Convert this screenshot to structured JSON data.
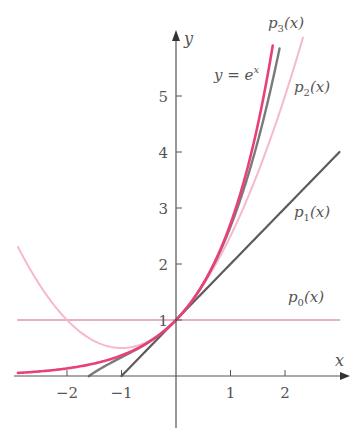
{
  "chart_data": {
    "type": "line",
    "title": "",
    "xlabel": "x",
    "ylabel": "y",
    "xlim": [
      -2.9,
      3.0
    ],
    "ylim": [
      0,
      6
    ],
    "grid": false,
    "legend": "inline labels",
    "x_ticks": [
      -2,
      -1,
      1,
      2
    ],
    "x_tick_labels": [
      "−2",
      "−1",
      "1",
      "2"
    ],
    "y_ticks": [
      1,
      2,
      3,
      4,
      5
    ],
    "y_tick_labels": [
      "1",
      "2",
      "3",
      "4",
      "5"
    ],
    "series": [
      {
        "name": "y = e^x",
        "label": "y = e",
        "label_sup": "x",
        "formula": "exp",
        "color": "#e8417a",
        "width": 2.6,
        "x_range": [
          -2.9,
          1.775
        ]
      },
      {
        "name": "p3(x)",
        "label": "p",
        "label_sub": "3",
        "label_tail": "(x)",
        "formula": "p3",
        "color": "#7a7a7a",
        "width": 2.4,
        "x_range": [
          -1.6,
          1.9
        ]
      },
      {
        "name": "p2(x)",
        "label": "p",
        "label_sub": "2",
        "label_tail": "(x)",
        "formula": "p2",
        "color": "#f5b8cf",
        "width": 2.0,
        "x_range": [
          -2.9,
          2.33
        ]
      },
      {
        "name": "p1(x)",
        "label": "p",
        "label_sub": "1",
        "label_tail": "(x)",
        "formula": "p1",
        "color": "#5f5a5c",
        "width": 2.2,
        "x_range": [
          -1.0,
          3.0
        ]
      },
      {
        "name": "p0(x)",
        "label": "p",
        "label_sub": "0",
        "label_tail": "(x)",
        "formula": "p0",
        "color": "#e3b3c2",
        "width": 2.0,
        "x_range": [
          -2.9,
          3.0
        ]
      }
    ],
    "annotations": [
      {
        "text": "y = e^x",
        "x": 1.0,
        "y": 5.4
      },
      {
        "text": "p3(x)",
        "x": 2.1,
        "y": 6.1
      },
      {
        "text": "p2(x)",
        "x": 2.2,
        "y": 5.1
      },
      {
        "text": "p1(x)",
        "x": 2.2,
        "y": 2.8
      },
      {
        "text": "p0(x)",
        "x": 2.2,
        "y": 1.3
      }
    ]
  }
}
